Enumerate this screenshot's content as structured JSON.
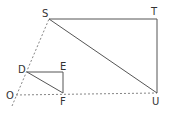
{
  "diagram": {
    "title": "",
    "points": {
      "S": {
        "label": "S",
        "x": 49,
        "y": 19
      },
      "T": {
        "label": "T",
        "x": 157,
        "y": 19
      },
      "U": {
        "label": "U",
        "x": 157,
        "y": 93
      },
      "D": {
        "label": "D",
        "x": 27,
        "y": 72
      },
      "E": {
        "label": "E",
        "x": 63,
        "y": 72
      },
      "F": {
        "label": "F",
        "x": 63,
        "y": 93
      },
      "O": {
        "label": "O",
        "x": 10,
        "y": 95
      }
    },
    "labels": {
      "S": "S",
      "T": "T",
      "U": "U",
      "D": "D",
      "E": "E",
      "F": "F",
      "O": "O"
    },
    "colors": {
      "line": "#555555",
      "text": "#333333"
    }
  }
}
